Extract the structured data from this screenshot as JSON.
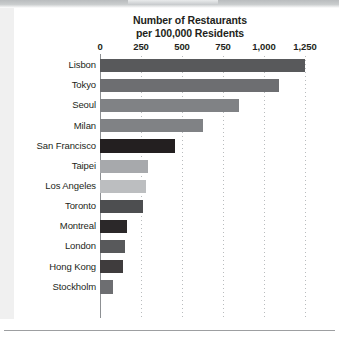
{
  "chart_data": {
    "type": "bar",
    "orientation": "horizontal",
    "title": "Number of Restaurants per 100,000 Residents",
    "title_lines": [
      "Number of Restaurants",
      "per 100,000 Residents"
    ],
    "xlabel": "",
    "ylabel": "",
    "xlim": [
      0,
      1250
    ],
    "grid": "vertical-dotted",
    "legend": "none",
    "tick_labels": [
      "0",
      "250",
      "500",
      "750",
      "1,000",
      "1,250"
    ],
    "tick_values": [
      0,
      250,
      500,
      750,
      1000,
      1250
    ],
    "categories": [
      "Lisbon",
      "Tokyo",
      "Seoul",
      "Milan",
      "San Francisco",
      "Taipei",
      "Los Angeles",
      "Toronto",
      "Montreal",
      "London",
      "Hong Kong",
      "Stockholm"
    ],
    "values": [
      1250,
      1090,
      845,
      630,
      460,
      290,
      280,
      265,
      165,
      155,
      140,
      80
    ],
    "bar_colors": [
      "#58595b",
      "#6d6e71",
      "#808285",
      "#808285",
      "#231f20",
      "#a7a9ac",
      "#bcbec0",
      "#4d4e50",
      "#2b2829",
      "#58595b",
      "#3f3c3d",
      "#6d6e71"
    ]
  },
  "colors": {
    "text": "#231f20",
    "axis": "#8d9093",
    "gridline": "#b9bcbe",
    "background": "#ffffff",
    "top_band": "#b9bcbe",
    "left_strip": "#f0f0f0",
    "bottom_rule": "#9d9fa1"
  }
}
